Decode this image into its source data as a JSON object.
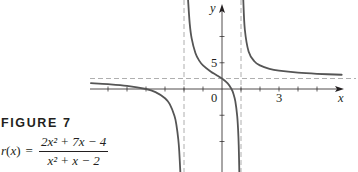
{
  "figure": {
    "label": "FIGURE 7",
    "function_lhs": "r(x)",
    "equals": "=",
    "numerator": "2x² + 7x − 4",
    "denominator": "x² + x − 2"
  },
  "chart_data": {
    "type": "line",
    "title": "FIGURE 7",
    "subtitle": "r(x) = (2x² + 7x − 4) / (x² + x − 2)",
    "xlabel": "x",
    "ylabel": "y",
    "xlim": [
      -6.9,
      6.3
    ],
    "ylim": [
      -16,
      17
    ],
    "grid": false,
    "legend": "none",
    "tick_labels": {
      "x": [
        {
          "value": 0,
          "label": "0"
        },
        {
          "value": 3,
          "label": "3"
        }
      ],
      "y": [
        {
          "value": 5,
          "label": "5"
        }
      ]
    },
    "x_ticks": [
      -6,
      -5,
      -4,
      -3,
      -2,
      -1,
      1,
      2,
      3,
      4,
      5
    ],
    "y_ticks": [
      -10,
      -5,
      5,
      10
    ],
    "asymptotes": {
      "vertical": [
        -2,
        1
      ],
      "horizontal": [
        2
      ]
    },
    "colors": {
      "curve": "#555555",
      "axis": "#231f20",
      "asymptote": "#9a9a9a"
    },
    "series": [
      {
        "name": "left branch",
        "x": [
          -6.9,
          -6,
          -5,
          -4,
          -3.5,
          -3,
          -2.75,
          -2.5,
          -2.4,
          -2.3,
          -2.25,
          -2.19
        ],
        "y": [
          1.109,
          0.929,
          0.611,
          0,
          -0.593,
          -1.75,
          -2.889,
          -5.143,
          -6.824,
          -9.616,
          -11.846,
          -16
        ]
      },
      {
        "name": "middle branch",
        "x": [
          -1.786,
          -1.7,
          -1.6,
          -1.4,
          -1.2,
          -1,
          -0.6,
          -0.3,
          0,
          0.3,
          0.5,
          0.6,
          0.7,
          0.8,
          0.85,
          0.88,
          0.913
        ],
        "y": [
          17,
          12.49,
          9.69,
          6.86,
          5.41,
          4.5,
          3.34,
          2.68,
          2,
          1.07,
          0,
          -0.885,
          -2.32,
          -5.14,
          -7.94,
          -10.73,
          -16
        ]
      },
      {
        "name": "right branch",
        "x": [
          1.12,
          1.2,
          1.4,
          1.7,
          2,
          2.5,
          3,
          4,
          5,
          6.3
        ],
        "y": [
          17,
          11.375,
          7.15,
          5.28,
          4.5,
          3.85,
          3.5,
          3.11,
          2.89,
          2.716
        ]
      }
    ]
  }
}
